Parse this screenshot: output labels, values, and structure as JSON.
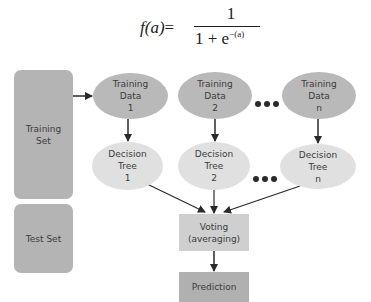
{
  "formula": {
    "lhs": "f(a)",
    "equals": "=",
    "numerator": "1",
    "denominator_base": "1 + e",
    "denominator_exponent": "−(a)"
  },
  "sets": {
    "training": "Training\nSet",
    "test": "Test Set"
  },
  "training_data": [
    {
      "label": "Training\nData\n1"
    },
    {
      "label": "Training\nData\n2"
    },
    {
      "label": "Training\nData\nn"
    }
  ],
  "decision_trees": [
    {
      "label": "Decision\nTree\n1"
    },
    {
      "label": "Decision\nTree\n2"
    },
    {
      "label": "Decision\nTree\nn"
    }
  ],
  "ellipsis_symbol": "•••",
  "voting": "Voting\n(averaging)",
  "prediction": "Prediction",
  "colors": {
    "set_box": "#b4b4b4",
    "training_data": "#b9b9b9",
    "decision_tree": "#e0e0e0",
    "voting": "#cfcfcf",
    "prediction": "#b0b0b0",
    "arrow": "#2a2a2a"
  }
}
